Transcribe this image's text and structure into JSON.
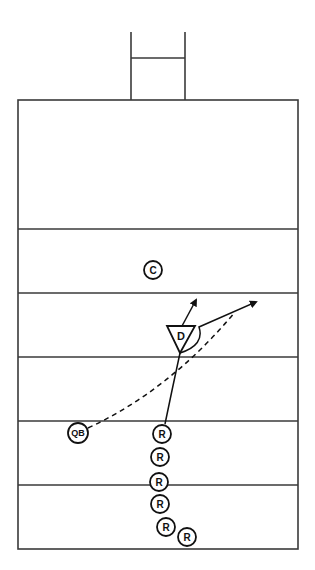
{
  "diagram": {
    "type": "football-play",
    "colors": {
      "line": "#3a3a3a",
      "ink": "#111111",
      "background": "#ffffff"
    },
    "field": {
      "left": 18,
      "right": 298,
      "top": 100,
      "bottom": 549,
      "yard_lines_y": [
        229,
        293,
        357,
        421,
        485
      ]
    },
    "goal_post": {
      "left_x": 131,
      "right_x": 185,
      "top_y": 32,
      "crossbar_y": 58,
      "base_y": 100
    },
    "players": [
      {
        "id": "center",
        "label": "C",
        "x": 153,
        "y": 270,
        "r": 9
      },
      {
        "id": "quarterback",
        "label": "QB",
        "x": 78,
        "y": 433,
        "r": 10
      },
      {
        "id": "receiver-1",
        "label": "R",
        "x": 162,
        "y": 434,
        "r": 9
      },
      {
        "id": "receiver-2",
        "label": "R",
        "x": 160,
        "y": 457,
        "r": 9
      },
      {
        "id": "receiver-3",
        "label": "R",
        "x": 159,
        "y": 482,
        "r": 9
      },
      {
        "id": "receiver-4",
        "label": "R",
        "x": 160,
        "y": 504,
        "r": 9
      },
      {
        "id": "receiver-5",
        "label": "R",
        "x": 166,
        "y": 527,
        "r": 9
      },
      {
        "id": "receiver-6",
        "label": "R",
        "x": 187,
        "y": 537,
        "r": 9
      }
    ],
    "defender": {
      "label": "D",
      "top_left": [
        167,
        326
      ],
      "top_right": [
        195,
        326
      ],
      "apex": [
        180,
        353
      ]
    },
    "routes": {
      "receiver_route": "M 165 424 Q 172 390 180 353",
      "break_route": "M 180 353 Q 205 345 199 327 L 256 302",
      "defender_drop": "M 182 326 L 196 300",
      "pass_path": "M 88 428 Q 170 390 235 312"
    }
  }
}
